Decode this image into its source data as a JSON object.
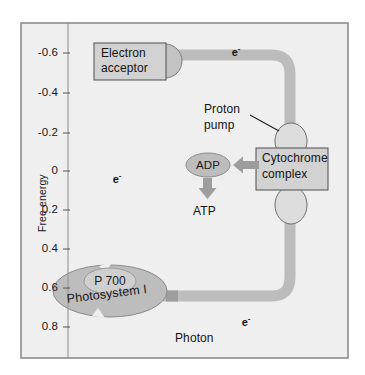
{
  "figure": {
    "background_color": "#efefef",
    "frame_color": "#8d8d8d",
    "band_color": "#b9b9b9",
    "shape_fill": "#bdbdbd",
    "shape_stroke": "#707070",
    "box_fill": "#d2d2d2",
    "box_stroke": "#555555",
    "arrow_color": "#9a9a9a"
  },
  "axis": {
    "title": "Free energy",
    "ticks": [
      {
        "label": "-0.6",
        "value": -0.6,
        "y": 53
      },
      {
        "label": "-0.4",
        "value": -0.4,
        "y": 93
      },
      {
        "label": "-0.2",
        "value": -0.2,
        "y": 133
      },
      {
        "label": "0",
        "value": 0,
        "y": 171
      },
      {
        "label": "0.2",
        "value": 0.2,
        "y": 210
      },
      {
        "label": "0.4",
        "value": 0.4,
        "y": 249
      },
      {
        "label": "0.6",
        "value": 0.6,
        "y": 288
      },
      {
        "label": "0.8",
        "value": 0.8,
        "y": 327
      }
    ]
  },
  "nodes": {
    "electron_acceptor": {
      "line1": "Electron",
      "line2": "acceptor"
    },
    "cytochrome_complex": {
      "line1": "Cytochrome",
      "line2": "complex"
    },
    "proton_pump": {
      "line1": "Proton",
      "line2": "pump"
    },
    "photosystem": {
      "center_label": "P 700",
      "ring_label": "Photosystem I"
    },
    "adp": "ADP",
    "atp": "ATP",
    "photon": "Photon"
  },
  "electron_markers": [
    {
      "id": "e-top",
      "label": "e",
      "charge": "-",
      "x": 219,
      "y": 39
    },
    {
      "id": "e-left",
      "label": "e",
      "charge": "-",
      "x": 100,
      "y": 161
    },
    {
      "id": "e-bottom",
      "label": "e",
      "charge": "-",
      "x": 229,
      "y": 302
    }
  ]
}
